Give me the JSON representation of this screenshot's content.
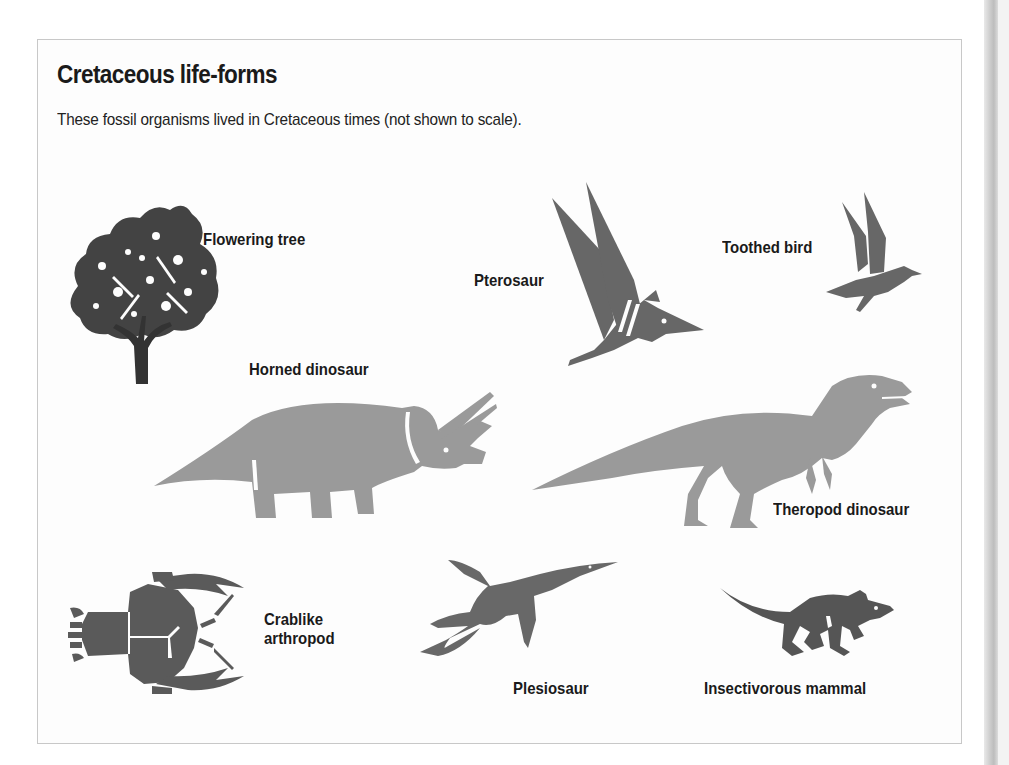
{
  "figure": {
    "title": "Cretaceous life-forms",
    "subtitle": "These fossil organisms lived in Cretaceous times (not shown to scale).",
    "organisms": [
      {
        "id": "flowering-tree",
        "label": "Flowering tree",
        "color": "#333333"
      },
      {
        "id": "pterosaur",
        "label": "Pterosaur",
        "color": "#676767"
      },
      {
        "id": "toothed-bird",
        "label": "Toothed bird",
        "color": "#676767"
      },
      {
        "id": "horned-dinosaur",
        "label": "Horned dinosaur",
        "color": "#9a9a9a"
      },
      {
        "id": "theropod-dinosaur",
        "label": "Theropod dinosaur",
        "color": "#9a9a9a"
      },
      {
        "id": "crablike-arthropod",
        "label_line1": "Crablike",
        "label_line2": "arthropod",
        "color": "#5a5a5a"
      },
      {
        "id": "plesiosaur",
        "label": "Plesiosaur",
        "color": "#686868"
      },
      {
        "id": "insectivorous-mammal",
        "label": "Insectivorous mammal",
        "color": "#555555"
      }
    ]
  }
}
